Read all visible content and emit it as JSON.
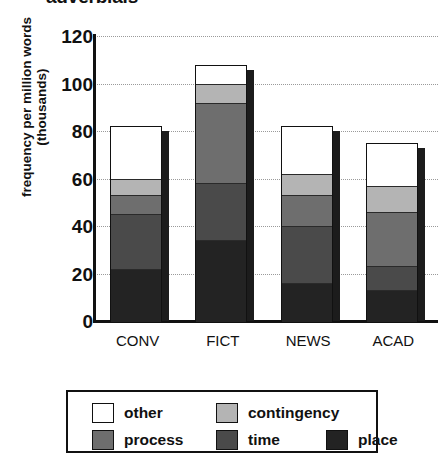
{
  "chart_data": {
    "type": "bar",
    "subtype": "stacked-bar",
    "title": "adverbials",
    "xlabel": "",
    "ylabel": "frequency per million words (thousands)",
    "ylim": [
      0,
      120
    ],
    "yticks": [
      0,
      20,
      40,
      60,
      80,
      100,
      120
    ],
    "grid": true,
    "grid_style": "dotted horizontal",
    "legend_position": "bottom",
    "categories": [
      "CONV",
      "FICT",
      "NEWS",
      "ACAD"
    ],
    "stack_order_bottom_to_top": [
      "place",
      "time",
      "process",
      "contingency",
      "other"
    ],
    "series": [
      {
        "name": "place",
        "color": "#232323",
        "values": [
          22,
          34,
          16,
          13
        ]
      },
      {
        "name": "time",
        "color": "#4a4a4a",
        "values": [
          23,
          24,
          24,
          10
        ]
      },
      {
        "name": "process",
        "color": "#6e6e6e",
        "values": [
          8,
          34,
          13,
          23
        ]
      },
      {
        "name": "contingency",
        "color": "#b4b4b4",
        "values": [
          7,
          8,
          9,
          11
        ]
      },
      {
        "name": "other",
        "color": "#ffffff",
        "values": [
          22,
          8,
          20,
          18
        ]
      }
    ],
    "totals": [
      82,
      108,
      82,
      75
    ]
  },
  "y_axis": {
    "label": "frequency per million words (thousands)",
    "ticks": [
      "120",
      "100",
      "80",
      "60",
      "40",
      "20",
      "0"
    ]
  },
  "x_axis": {
    "labels": [
      "CONV",
      "FICT",
      "NEWS",
      "ACAD"
    ]
  },
  "legend": {
    "rows": [
      [
        {
          "label": "other",
          "color": "#ffffff",
          "swatch_name": "legend-swatch-other"
        },
        {
          "label": "contingency",
          "color": "#b4b4b4",
          "swatch_name": "legend-swatch-contingency"
        }
      ],
      [
        {
          "label": "process",
          "color": "#6e6e6e",
          "swatch_name": "legend-swatch-process"
        },
        {
          "label": "time",
          "color": "#4a4a4a",
          "swatch_name": "legend-swatch-time"
        },
        {
          "label": "place",
          "color": "#232323",
          "swatch_name": "legend-swatch-place"
        }
      ]
    ]
  },
  "colors": {
    "axis": "#111111",
    "grid": "#9a9a9a",
    "background": "#ffffff",
    "bar_shadow": "#1c1c1c"
  }
}
